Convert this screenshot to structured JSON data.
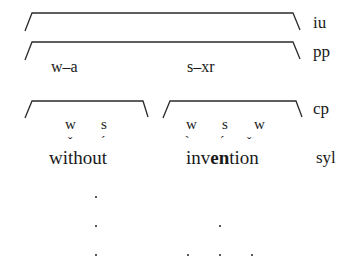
{
  "tiers": {
    "iu": "iu",
    "pp": "pp",
    "cp": "cp",
    "syl": "syl"
  },
  "pp_groups": {
    "left": "w–a",
    "right": "s–xr"
  },
  "cp_left": {
    "labels": [
      "w",
      "s"
    ]
  },
  "cp_right": {
    "labels": [
      "w",
      "s",
      "w"
    ]
  },
  "words": {
    "without": {
      "pre": "w",
      "i": "i",
      "mid": "th",
      "o": "o",
      "post": "ut"
    },
    "invention": {
      "pre": "",
      "i": "i",
      "mid1": "nv",
      "e": "e",
      "n": "n",
      "mid2": "t",
      "i2": "i",
      "post": "on"
    }
  },
  "accents": {
    "without_w": "ˇ",
    "without_s": "ˊ",
    "invention_w1": "ˋ",
    "invention_s": "ˊ",
    "invention_w2": "ˇ"
  },
  "grid_dots": {
    "without_column": [
      3
    ],
    "invention_columns": [
      1,
      2,
      1
    ]
  }
}
